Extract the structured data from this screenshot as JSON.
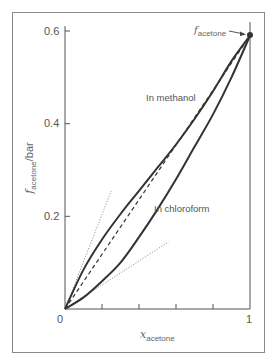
{
  "chart_data": {
    "type": "line",
    "title": "",
    "xlabel": "x_acetone",
    "ylabel": "f_acetone /bar",
    "xlim": [
      0,
      1
    ],
    "ylim": [
      0,
      0.6
    ],
    "x_ticks": [
      0,
      0.2,
      0.4,
      0.6,
      0.8,
      1
    ],
    "x_tick_labels": [
      "0",
      "",
      "",
      "",
      "",
      "1"
    ],
    "y_ticks": [
      0,
      0.2,
      0.4,
      0.6
    ],
    "y_tick_labels": [
      "0",
      "0.2",
      "0.4",
      "0.6"
    ],
    "grid": false,
    "legend": null,
    "x": [
      0,
      0.1,
      0.2,
      0.3,
      0.4,
      0.5,
      0.6,
      0.7,
      0.8,
      0.9,
      1.0
    ],
    "series": [
      {
        "name": "In methanol",
        "style": "solid",
        "values": [
          0,
          0.085,
          0.15,
          0.205,
          0.255,
          0.305,
          0.355,
          0.41,
          0.47,
          0.535,
          0.59
        ]
      },
      {
        "name": "In chloroform",
        "style": "solid",
        "values": [
          0,
          0.025,
          0.06,
          0.1,
          0.155,
          0.215,
          0.28,
          0.35,
          0.42,
          0.5,
          0.59
        ]
      },
      {
        "name": "Ideal (Raoult's law)",
        "style": "dashed",
        "values": [
          0,
          0.059,
          0.118,
          0.177,
          0.236,
          0.295,
          0.354,
          0.413,
          0.472,
          0.531,
          0.59
        ]
      }
    ],
    "tangent_lines": [
      {
        "name": "Henry's law tangent (methanol)",
        "style": "dotted",
        "from": [
          0,
          0
        ],
        "to": [
          0.25,
          0.255
        ]
      },
      {
        "name": "Henry's law tangent (chloroform)",
        "style": "dotted",
        "from": [
          0,
          0
        ],
        "to": [
          0.56,
          0.145
        ]
      }
    ],
    "annotations": [
      {
        "text": "f*acetone",
        "target": [
          1,
          0.59
        ],
        "arrow": true
      },
      {
        "text": "In methanol",
        "at": [
          0.43,
          0.45
        ]
      },
      {
        "text": "In chloroform",
        "at": [
          0.47,
          0.21
        ]
      }
    ]
  },
  "labels": {
    "y_axis_main": "f",
    "y_axis_sub": "acetone",
    "y_axis_unit": "/bar",
    "x_axis_main": "x",
    "x_axis_sub": "acetone",
    "pure_point_main": "f",
    "pure_point_sub": "acetone",
    "methanol": "In methanol",
    "chloroform": "In chloroform",
    "y_06": "0.6",
    "y_04": "0.4",
    "y_02": "0.2",
    "x_0": "0",
    "x_1": "1"
  },
  "colors": {
    "curve": "#333333",
    "axis": "#555555",
    "dotted": "#888888",
    "frame": "#8a8a8a"
  }
}
